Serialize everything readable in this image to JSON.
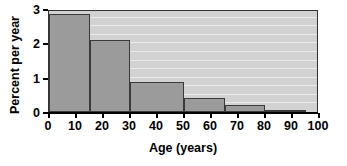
{
  "chart_data": {
    "type": "bar",
    "title": "",
    "subtitle": "",
    "xlabel": "Age (years)",
    "ylabel": "Percent per year",
    "xlim": [
      0,
      100
    ],
    "ylim": [
      0,
      3
    ],
    "grid": true,
    "legend": null,
    "legend_position": "none",
    "xticks": [
      0,
      10,
      20,
      30,
      40,
      50,
      60,
      70,
      80,
      90,
      100
    ],
    "xtick_labels": [
      "0",
      "10",
      "20",
      "30",
      "40",
      "50",
      "60",
      "70",
      "80",
      "90",
      "100"
    ],
    "yticks": [
      0,
      1,
      2,
      3
    ],
    "ytick_labels": [
      "0",
      "1",
      "2",
      "3"
    ],
    "bin_edges": [
      0,
      15,
      30,
      50,
      65,
      80,
      95
    ],
    "categories": [
      "0-15",
      "15-30",
      "30-50",
      "50-65",
      "65-80",
      "80-95"
    ],
    "values": [
      2.85,
      2.1,
      0.88,
      0.41,
      0.19,
      0.05
    ],
    "bars": [
      {
        "label": "0-15",
        "x0": 0,
        "x1": 15,
        "value": 2.85
      },
      {
        "label": "15-30",
        "x0": 15,
        "x1": 30,
        "value": 2.1
      },
      {
        "label": "30-50",
        "x0": 30,
        "x1": 50,
        "value": 0.88
      },
      {
        "label": "50-65",
        "x0": 50,
        "x1": 65,
        "value": 0.41
      },
      {
        "label": "65-80",
        "x0": 65,
        "x1": 80,
        "value": 0.19
      },
      {
        "label": "80-95",
        "x0": 80,
        "x1": 95,
        "value": 0.05
      }
    ],
    "colors": {
      "bar_fill": "#9b9b9b",
      "bar_edge": "#3a3a3a",
      "panel_background": "#d2d2d2",
      "gridline": "#efefef",
      "axis": "#000000",
      "text": "#000000",
      "figure_background": "#ffffff"
    }
  }
}
